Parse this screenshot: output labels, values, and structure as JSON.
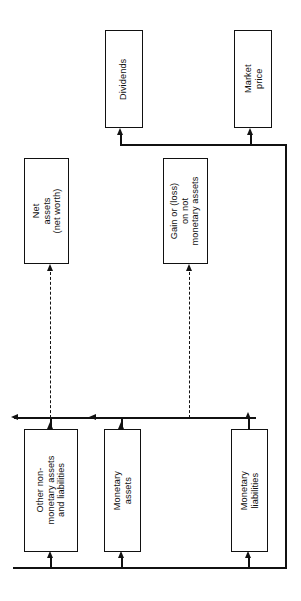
{
  "diagram": {
    "orientation": "rotated-90",
    "stroke_color": "#111111",
    "background_color": "#ffffff",
    "nodes": [
      {
        "id": "dividends",
        "label": "Dividends"
      },
      {
        "id": "market-price",
        "label": "Market\nprice"
      },
      {
        "id": "net-assets",
        "label": "Net\nassets\n(net worth)"
      },
      {
        "id": "gain-or-loss",
        "label": "Gain or (loss)\non not\nmonetary assets"
      },
      {
        "id": "other-non-monetary",
        "label": "Other non-\nmonetary assets\nand liabilities"
      },
      {
        "id": "monetary-assets",
        "label": "Monetary\nassets"
      },
      {
        "id": "monetary-liabilities",
        "label": "Monetary\nliabilities"
      }
    ],
    "connectors": [
      {
        "id": "bottom-bus",
        "kind": "solid-horizontal"
      },
      {
        "id": "middle-bus",
        "kind": "solid-horizontal"
      },
      {
        "id": "top-bus",
        "kind": "solid-horizontal"
      },
      {
        "id": "right-riser",
        "kind": "solid-vertical"
      },
      {
        "id": "net-assets-feed",
        "kind": "dashed-vertical"
      },
      {
        "id": "gain-loss-feed",
        "kind": "dashed-vertical"
      }
    ]
  }
}
